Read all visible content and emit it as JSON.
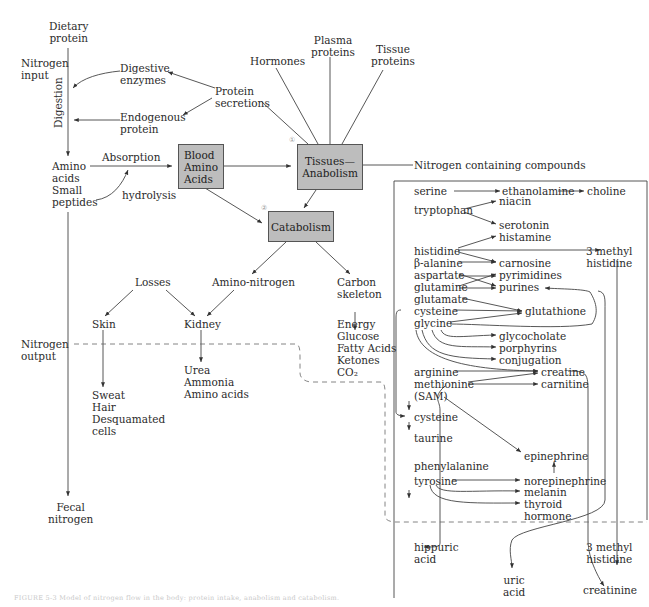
{
  "diagram": {
    "intake": {
      "dietary_protein": "Dietary\nprotein",
      "nitrogen_input": "Nitrogen\ninput",
      "digestion": "Digestion",
      "digestive_enzymes": "Digestive\nenzymes",
      "endogenous_protein": "Endogenous\nprotein",
      "protein_secretions": "Protein\nsecretions",
      "amino_acids_small_peptides": "Amino\nacids\nSmall\npeptides",
      "absorption": "Absorption",
      "hydrolysis": "hydrolysis"
    },
    "boxes": {
      "blood_amino_acids": "Blood\nAmino\nAcids",
      "tissues_anabolism": "Tissues—\nAnabolism",
      "catabolism": "Catabolism",
      "marker_1": "①",
      "marker_2": "②"
    },
    "anabolism_products": {
      "hormones": "Hormones",
      "plasma_proteins": "Plasma\nproteins",
      "tissue_proteins": "Tissue\nproteins",
      "nitrogen_containing_compounds": "Nitrogen containing compounds"
    },
    "catabolism_products": {
      "losses": "Losses",
      "amino_nitrogen": "Amino-nitrogen",
      "carbon_skeleton": "Carbon\nskeleton",
      "skin": "Skin",
      "kidney": "Kidney",
      "energy_list": "Energy\nGlucose\nFatty Acids\nKetones\nCO₂",
      "skin_losses": "Sweat\nHair\nDesquamated\ncells",
      "kidney_losses": "Urea\nAmmonia\nAmino acids"
    },
    "output": {
      "nitrogen_output": "Nitrogen\noutput",
      "fecal_nitrogen": "Fecal\nnitrogen"
    },
    "compounds_panel": {
      "serine": "serine",
      "ethanolamine": "ethanolamine",
      "choline": "choline",
      "tryptophan": "tryptophan",
      "niacin": "niacin",
      "serotonin": "serotonin",
      "histamine": "histamine",
      "histidine": "histidine",
      "methyl_histidine_1": "3 methyl\nhistidine",
      "beta_alanine": "β-alanine",
      "carnosine": "carnosine",
      "aspartate": "aspartate",
      "pyrimidines": "pyrimidines",
      "glutamine": "glutamine",
      "purines": "purines",
      "glutamate": "glutamate",
      "cysteine_1": "cysteine",
      "glutathione": "glutathione",
      "glycine": "glycine",
      "glycocholate": "glycocholate",
      "porphyrins": "porphyrins",
      "conjugation": "conjugation",
      "arginine": "arginine",
      "creatine": "creatine",
      "methionine": "methionine",
      "carnitine": "carnitine",
      "sam": "(SAM)",
      "cysteine_2": "cysteine",
      "taurine": "taurine",
      "epinephrine": "epinephrine",
      "phenylalanine": "phenylalanine",
      "tyrosine": "tyrosine",
      "norepinephrine": "norepinephrine",
      "melanin": "melanin",
      "thyroid_hormone": "thyroid\nhormone",
      "hippuric_acid": "hippuric\nacid",
      "uric_acid": "uric\nacid",
      "methyl_histidine_2": "3 methyl\nhistidine",
      "creatinine": "creatinine"
    },
    "caption": "FIGURE 5-3  Model of nitrogen flow in the body: protein intake, anabolism and catabolism."
  }
}
